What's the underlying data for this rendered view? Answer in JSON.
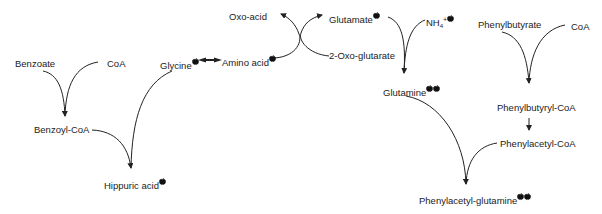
{
  "diagram": {
    "nodes": {
      "benzoate": {
        "label": "Benzoate"
      },
      "coa_left": {
        "label": "CoA"
      },
      "glycine": {
        "label": "Glycine",
        "marked": 1
      },
      "benzoyl_coa": {
        "label": "Benzoyl-CoA"
      },
      "hippuric_acid": {
        "label": "Hippuric acid",
        "marked": 1
      },
      "amino_acid": {
        "label": "Amino acid",
        "marked": 1
      },
      "oxo_acid": {
        "label": "Oxo-acid"
      },
      "glutamate": {
        "label": "Glutamate",
        "marked": 1
      },
      "oxo_glutarate": {
        "label": "2-Oxo-glutarate"
      },
      "nh4": {
        "label": "NH",
        "sub": "4",
        "sup": "+",
        "marked": 1
      },
      "glutamine": {
        "label": "Glutamine",
        "marked": 2
      },
      "phenylbutyrate": {
        "label": "Phenylbutyrate"
      },
      "coa_right": {
        "label": "CoA"
      },
      "phenylbutyryl_coa": {
        "label": "Phenylbutyryl-CoA"
      },
      "phenylacetyl_coa": {
        "label": "Phenylacetyl-CoA"
      },
      "phenylacetyl_glutamine": {
        "label": "Phenylacetyl-glutamine",
        "marked": 2
      }
    },
    "edges": [
      {
        "from": "benzoate",
        "to": "benzoyl_coa"
      },
      {
        "from": "coa_left",
        "to": "benzoyl_coa"
      },
      {
        "from": "benzoyl_coa",
        "to": "hippuric_acid"
      },
      {
        "from": "glycine",
        "to": "hippuric_acid"
      },
      {
        "from": "amino_acid",
        "to": "glycine",
        "bidirectional": true
      },
      {
        "from": "amino_acid",
        "to": "oxo_acid"
      },
      {
        "from": "oxo_glutarate",
        "to": "glutamate"
      },
      {
        "from": "glutamate",
        "to": "glutamine"
      },
      {
        "from": "nh4",
        "to": "glutamine"
      },
      {
        "from": "phenylbutyrate",
        "to": "phenylbutyryl_coa"
      },
      {
        "from": "coa_right",
        "to": "phenylbutyryl_coa"
      },
      {
        "from": "phenylbutyryl_coa",
        "to": "phenylacetyl_coa"
      },
      {
        "from": "glutamine",
        "to": "phenylacetyl_glutamine"
      },
      {
        "from": "phenylacetyl_coa",
        "to": "phenylacetyl_glutamine"
      }
    ],
    "marker_icon": "apple-icon",
    "colors": {
      "line": "#222222",
      "text": "#222222",
      "marker": "#111111"
    }
  }
}
